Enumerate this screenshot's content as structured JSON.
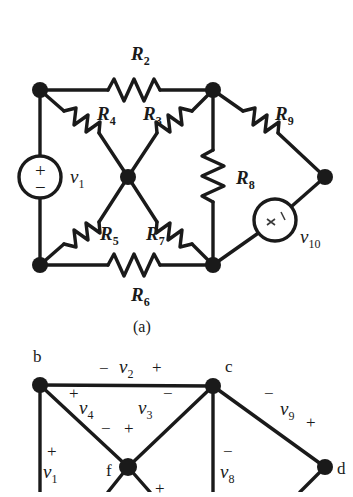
{
  "figure": {
    "caption_a": "(a)",
    "parts": [
      {
        "id": "a",
        "type": "circuit-schematic"
      },
      {
        "id": "b",
        "type": "circuit-graph"
      }
    ]
  },
  "circuit_a": {
    "source_v1": {
      "label": "v",
      "sub": "1",
      "plus": "+",
      "minus": "−",
      "cx": 40,
      "cy": 177,
      "r": 21
    },
    "source_v10": {
      "label": "v",
      "sub": "10",
      "plus": "+",
      "minus": "−",
      "cx": 275,
      "cy": 220,
      "r": 21
    },
    "resistors": [
      {
        "name": "R",
        "sub": "2",
        "label_x": 131,
        "label_y": 53
      },
      {
        "name": "R",
        "sub": "4",
        "label_x": 97,
        "label_y": 113
      },
      {
        "name": "R",
        "sub": "3",
        "label_x": 143,
        "label_y": 113
      },
      {
        "name": "R",
        "sub": "9",
        "label_x": 275,
        "label_y": 113
      },
      {
        "name": "R",
        "sub": "8",
        "label_x": 236,
        "label_y": 168
      },
      {
        "name": "R",
        "sub": "5",
        "label_x": 100,
        "label_y": 224
      },
      {
        "name": "R",
        "sub": "7",
        "label_x": 146,
        "label_y": 224
      },
      {
        "name": "R",
        "sub": "6",
        "label_x": 131,
        "label_y": 287
      }
    ],
    "nodes": [
      {
        "name": "top-left",
        "x": 40,
        "y": 90
      },
      {
        "name": "top-right",
        "x": 213,
        "y": 90
      },
      {
        "name": "center",
        "x": 128,
        "y": 177
      },
      {
        "name": "far-right",
        "x": 325,
        "y": 177
      },
      {
        "name": "bottom-left",
        "x": 40,
        "y": 265
      },
      {
        "name": "bottom-right",
        "x": 213,
        "y": 265
      }
    ]
  },
  "circuit_b": {
    "nodes": [
      {
        "name": "b",
        "label": "b",
        "x": 40,
        "y": 385,
        "label_x": 33,
        "label_y": 348
      },
      {
        "name": "c",
        "label": "c",
        "x": 213,
        "y": 386,
        "label_x": 225,
        "label_y": 358
      },
      {
        "name": "f",
        "label": "f",
        "x": 128,
        "y": 467,
        "label_x": 106,
        "label_y": 462
      },
      {
        "name": "d",
        "label": "d",
        "x": 325,
        "y": 467,
        "label_x": 337,
        "label_y": 460
      }
    ],
    "branch_labels": [
      {
        "name": "v2",
        "label": "v",
        "sub": "2",
        "x": 122,
        "y": 361,
        "minus_x": 99,
        "minus_y": 360,
        "plus_x": 152,
        "plus_y": 361
      },
      {
        "name": "v4",
        "label": "v",
        "sub": "4",
        "x": 82,
        "y": 403,
        "plus_x": 71,
        "plus_y": 386,
        "minus_x": 103,
        "minus_y": 427
      },
      {
        "name": "v3",
        "label": "v",
        "sub": "3",
        "x": 140,
        "y": 403,
        "minus_x": 164,
        "minus_y": 386,
        "plus_x": 125,
        "plus_y": 427
      },
      {
        "name": "v9",
        "label": "v",
        "sub": "9",
        "x": 282,
        "y": 405,
        "minus_x": 265,
        "minus_y": 387,
        "plus_x": 305,
        "plus_y": 423
      },
      {
        "name": "v1",
        "label": "v",
        "sub": "1",
        "x": 42,
        "y": 467,
        "plus_x": 47,
        "plus_y": 443
      },
      {
        "name": "v8",
        "label": "v",
        "sub": "8",
        "x": 224,
        "y": 467,
        "minus_x": 224,
        "minus_y": 443
      },
      {
        "name": "v7plus",
        "label": "",
        "sub": "",
        "plus_x": 155,
        "plus_y": 484
      }
    ]
  },
  "colors": {
    "ink": "#1a1a1a",
    "background": "#ffffff"
  }
}
